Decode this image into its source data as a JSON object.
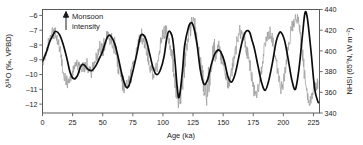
{
  "chart_data": {
    "type": "line",
    "title": "",
    "xlabel": "Age (ka)",
    "ylabel": "δ¹⁸O (‰, VPBD)",
    "y2label": "NHSI (65°N, W m⁻²)",
    "xlim": [
      0,
      230
    ],
    "ylim": [
      -12.6,
      -5.6
    ],
    "y2lim": [
      340,
      440
    ],
    "xticks": [
      0,
      25,
      50,
      75,
      100,
      125,
      150,
      175,
      200,
      225
    ],
    "xticklabels": [
      "0",
      "25",
      "50",
      "75",
      "100",
      "125",
      "150",
      "175",
      "200",
      "225"
    ],
    "yticks": [
      -12,
      -11,
      -10,
      -9,
      -8,
      -7,
      -6
    ],
    "yticklabels": [
      "–12",
      "–11",
      "–10",
      "–9",
      "–8",
      "–7",
      "–6"
    ],
    "y2ticks": [
      340,
      360,
      380,
      400,
      420,
      440
    ],
    "y2ticklabels": [
      "340",
      "360",
      "380",
      "400",
      "420",
      "440"
    ],
    "y_inverted": true,
    "grid": false,
    "legend": "none",
    "annotations": [
      {
        "name": "monsoon-intensity",
        "text_line1": "Monsoon",
        "text_line2": "intensity",
        "arrow": "up",
        "x": 25,
        "y2": 437
      }
    ],
    "colors": {
      "insolation": "#0d0d0d",
      "speleothem": "#9e9e9e",
      "axis": "#5a5a5a"
    },
    "series": [
      {
        "name": "NHSI 65°N insolation",
        "axis": "right",
        "color": "#0d0d0d",
        "x": [
          0,
          3,
          6,
          9,
          11,
          14,
          17,
          20,
          23,
          26,
          29,
          31,
          33,
          35,
          38,
          41,
          44,
          47,
          50,
          53,
          55,
          57,
          60,
          63,
          66,
          69,
          71,
          73,
          76,
          79,
          81,
          83,
          86,
          89,
          92,
          95,
          98,
          101,
          103,
          105,
          108,
          110,
          113,
          116,
          118,
          121,
          123,
          125,
          128,
          131,
          134,
          137,
          140,
          143,
          146,
          148,
          151,
          154,
          157,
          160,
          163,
          166,
          169,
          172,
          174,
          176,
          179,
          182,
          185,
          188,
          191,
          194,
          196,
          198,
          201,
          204,
          207,
          210,
          213,
          216,
          218,
          220,
          223,
          226,
          229
        ],
        "values": [
          390,
          398,
          409,
          416,
          419,
          416,
          407,
          394,
          379,
          373,
          376,
          383,
          387,
          386,
          382,
          381,
          385,
          392,
          400,
          411,
          415,
          414,
          407,
          393,
          377,
          366,
          365,
          371,
          385,
          401,
          413,
          416,
          411,
          397,
          383,
          377,
          382,
          395,
          411,
          419,
          412,
          390,
          355,
          378,
          405,
          422,
          427,
          425,
          409,
          382,
          368,
          372,
          386,
          397,
          401,
          399,
          390,
          375,
          370,
          378,
          394,
          410,
          419,
          418,
          410,
          402,
          385,
          369,
          362,
          372,
          389,
          409,
          416,
          418,
          410,
          392,
          372,
          363,
          383,
          417,
          437,
          431,
          399,
          363,
          350
        ]
      },
      {
        "name": "Speleothem δ¹⁸O",
        "axis": "left",
        "color": "#9e9e9e",
        "note": "High-resolution noisy record tracking insolation",
        "x": [
          0,
          2,
          4,
          6,
          8,
          10,
          12,
          14,
          16,
          18,
          20,
          22,
          24,
          26,
          28,
          30,
          32,
          34,
          36,
          38,
          40,
          42,
          44,
          46,
          48,
          50,
          52,
          54,
          56,
          58,
          60,
          62,
          64,
          66,
          68,
          70,
          72,
          74,
          76,
          78,
          80,
          82,
          84,
          86,
          88,
          90,
          92,
          94,
          96,
          98,
          100,
          102,
          104,
          106,
          108,
          110,
          112,
          114,
          116,
          118,
          120,
          122,
          124,
          126,
          128,
          130,
          132,
          134,
          136,
          138,
          140,
          142,
          144,
          146,
          148,
          150,
          152,
          154,
          156,
          158,
          160,
          162,
          164,
          166,
          168,
          170,
          172,
          174,
          176,
          178,
          180,
          182,
          184,
          186,
          188,
          190,
          192,
          194,
          196,
          198,
          200,
          202,
          204,
          206,
          208,
          210,
          212,
          214,
          216,
          218,
          220,
          222,
          224,
          226
        ],
        "values": [
          389,
          396,
          404,
          412,
          418,
          419,
          413,
          404,
          390,
          376,
          370,
          372,
          379,
          384,
          389,
          385,
          380,
          383,
          389,
          383,
          378,
          384,
          390,
          396,
          403,
          401,
          409,
          414,
          416,
          410,
          403,
          392,
          381,
          372,
          366,
          364,
          370,
          379,
          389,
          400,
          410,
          415,
          412,
          404,
          392,
          381,
          375,
          381,
          392,
          405,
          415,
          420,
          416,
          405,
          391,
          377,
          360,
          352,
          368,
          390,
          408,
          420,
          427,
          422,
          412,
          398,
          381,
          366,
          358,
          372,
          386,
          397,
          402,
          404,
          398,
          388,
          376,
          368,
          372,
          385,
          399,
          412,
          419,
          417,
          409,
          399,
          387,
          373,
          361,
          358,
          368,
          383,
          400,
          412,
          418,
          415,
          405,
          390,
          374,
          364,
          368,
          384,
          402,
          416,
          426,
          432,
          430,
          418,
          398,
          372,
          355,
          350,
          358,
          366
        ]
      }
    ]
  },
  "axis_labels": {
    "left": "δ¹⁸O (‰, VPBD)",
    "right": "NHSI (65°N, W m⁻²)",
    "bottom": "Age (ka)"
  },
  "annotation": {
    "line1": "Monsoon",
    "line2": "intensity"
  }
}
